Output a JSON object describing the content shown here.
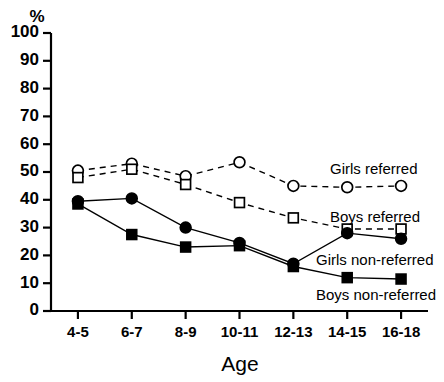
{
  "chart_data": {
    "type": "line",
    "title": "",
    "xlabel": "Age",
    "ylabel": "%",
    "categories": [
      "4-5",
      "6-7",
      "8-9",
      "10-11",
      "12-13",
      "14-15",
      "16-18"
    ],
    "ylim": [
      0,
      100
    ],
    "yticks": [
      0,
      10,
      20,
      30,
      40,
      50,
      60,
      70,
      80,
      90,
      100
    ],
    "grid": false,
    "legend": "inline-right",
    "series": [
      {
        "name": "Girls referred",
        "marker": "open-circle",
        "linestyle": "dashed",
        "values": [
          50.5,
          53,
          48.5,
          53.5,
          45,
          44.5,
          45
        ]
      },
      {
        "name": "Boys referred",
        "marker": "open-square",
        "linestyle": "dashed",
        "values": [
          48,
          51,
          45.5,
          39,
          33.5,
          29.5,
          29.5
        ]
      },
      {
        "name": "Girls non-referred",
        "marker": "filled-circle",
        "linestyle": "solid",
        "values": [
          39.5,
          40.5,
          30,
          24.5,
          17,
          28,
          26
        ]
      },
      {
        "name": "Boys non-referred",
        "marker": "filled-square",
        "linestyle": "solid",
        "values": [
          38.5,
          27.5,
          23,
          23.5,
          16,
          12,
          11.5
        ]
      }
    ]
  },
  "axis": {
    "y_unit_label": "%",
    "x_title": "Age"
  }
}
